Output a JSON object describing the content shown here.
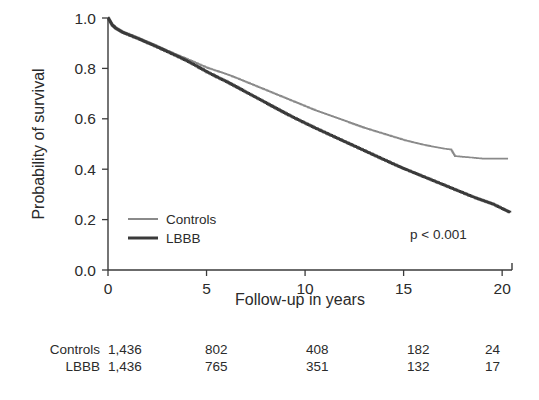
{
  "chart_data": {
    "type": "line",
    "title": "",
    "xlabel": "Follow-up in years",
    "ylabel": "Probability of survival",
    "xlim": [
      0,
      20.5
    ],
    "ylim": [
      0.0,
      1.0
    ],
    "xticks": [
      0,
      5,
      10,
      15,
      20
    ],
    "xticklabels": [
      "0",
      "5",
      "10",
      "15",
      "20"
    ],
    "yticks": [
      0.0,
      0.2,
      0.4,
      0.6,
      0.8,
      1.0
    ],
    "yticklabels": [
      "0.0",
      "0.2",
      "0.4",
      "0.6",
      "0.8",
      "1.0"
    ],
    "grid": false,
    "legend_position": "lower left",
    "annotation": "p < 0.001",
    "series": [
      {
        "name": "Controls",
        "color": "#8a8a8a",
        "linewidth": 1.6,
        "x": [
          0,
          0.2,
          0.4,
          0.7,
          1.0,
          1.5,
          2.0,
          2.5,
          3.0,
          3.5,
          4.0,
          4.5,
          5.0,
          5.5,
          6.0,
          6.5,
          7.0,
          7.5,
          8.0,
          8.5,
          9.0,
          9.5,
          10.0,
          10.5,
          11.0,
          11.5,
          12.0,
          12.5,
          13.0,
          13.5,
          14.0,
          14.5,
          15.0,
          15.5,
          16.0,
          16.5,
          17.0,
          17.4,
          17.6,
          18.0,
          18.6,
          19.0,
          20.3
        ],
        "y": [
          1.0,
          0.975,
          0.962,
          0.948,
          0.938,
          0.922,
          0.905,
          0.888,
          0.87,
          0.853,
          0.837,
          0.82,
          0.803,
          0.79,
          0.777,
          0.762,
          0.746,
          0.73,
          0.714,
          0.698,
          0.682,
          0.666,
          0.65,
          0.634,
          0.62,
          0.606,
          0.592,
          0.578,
          0.564,
          0.552,
          0.54,
          0.528,
          0.516,
          0.506,
          0.497,
          0.489,
          0.482,
          0.478,
          0.452,
          0.449,
          0.445,
          0.442,
          0.442
        ]
      },
      {
        "name": "LBBB",
        "color": "#3a3a3a",
        "linewidth": 2.4,
        "x": [
          0,
          0.2,
          0.4,
          0.7,
          1.0,
          1.5,
          2.0,
          2.5,
          3.0,
          3.5,
          4.0,
          4.5,
          5.0,
          5.5,
          6.0,
          6.5,
          7.0,
          7.5,
          8.0,
          8.5,
          9.0,
          9.5,
          10.0,
          10.5,
          11.0,
          11.5,
          12.0,
          12.5,
          13.0,
          13.5,
          14.0,
          14.5,
          15.0,
          15.5,
          16.0,
          16.5,
          17.0,
          17.5,
          18.0,
          18.5,
          19.0,
          19.5,
          20.0,
          20.4
        ],
        "y": [
          1.0,
          0.972,
          0.958,
          0.944,
          0.934,
          0.918,
          0.901,
          0.884,
          0.866,
          0.848,
          0.829,
          0.808,
          0.786,
          0.766,
          0.747,
          0.726,
          0.705,
          0.684,
          0.663,
          0.642,
          0.621,
          0.601,
          0.582,
          0.563,
          0.545,
          0.527,
          0.509,
          0.491,
          0.473,
          0.455,
          0.437,
          0.419,
          0.402,
          0.386,
          0.37,
          0.354,
          0.338,
          0.322,
          0.306,
          0.29,
          0.276,
          0.262,
          0.243,
          0.228
        ]
      }
    ],
    "legend": [
      {
        "label": "Controls",
        "color": "#8a8a8a"
      },
      {
        "label": "LBBB",
        "color": "#3a3a3a"
      }
    ],
    "risk_table": {
      "columns_at_x": [
        0,
        5,
        10,
        15,
        20
      ],
      "rows": [
        {
          "label": "Controls",
          "values": [
            "1,436",
            "802",
            "408",
            "182",
            "24"
          ]
        },
        {
          "label": "LBBB",
          "values": [
            "1,436",
            "765",
            "351",
            "132",
            "17"
          ]
        }
      ]
    }
  },
  "axes": {
    "ylabel": "Probability of survival",
    "xlabel": "Follow-up in years",
    "xticklabels": [
      "0",
      "5",
      "10",
      "15",
      "20"
    ],
    "yticklabels": [
      "0.0",
      "0.2",
      "0.4",
      "0.6",
      "0.8",
      "1.0"
    ]
  },
  "legend": {
    "items": [
      {
        "label": "Controls"
      },
      {
        "label": "LBBB"
      }
    ]
  },
  "annotation": {
    "pvalue": "p < 0.001"
  },
  "risk_table": {
    "rows": [
      {
        "label": "Controls",
        "v0": "1,436",
        "v5": "802",
        "v10": "408",
        "v15": "182",
        "v20": "24"
      },
      {
        "label": "LBBB",
        "v0": "1,436",
        "v5": "765",
        "v10": "351",
        "v15": "132",
        "v20": "17"
      }
    ]
  },
  "colors": {
    "controls": "#8a8a8a",
    "lbbb": "#3a3a3a",
    "axis": "#3a3a3a",
    "text": "#2b2b2b",
    "background": "#ffffff"
  }
}
